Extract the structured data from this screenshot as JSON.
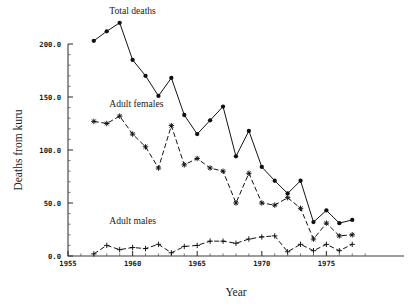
{
  "chart_data": {
    "type": "line",
    "title": "",
    "xlabel": "Year",
    "ylabel": "Deaths from kuru",
    "xlim": [
      1955,
      1978
    ],
    "ylim": [
      0,
      230
    ],
    "grid": false,
    "legend_position": "inline-annotations",
    "x_ticks": [
      "1955",
      "1960",
      "1965",
      "1970",
      "1975"
    ],
    "x_tick_values": [
      1955,
      1960,
      1965,
      1970,
      1975
    ],
    "y_ticks": [
      "0.0",
      "50.0",
      "100.0",
      "150.0",
      "200.0"
    ],
    "y_tick_values": [
      0,
      50,
      100,
      150,
      200
    ],
    "x": [
      1957,
      1958,
      1959,
      1960,
      1961,
      1962,
      1963,
      1964,
      1965,
      1966,
      1967,
      1968,
      1969,
      1970,
      1971,
      1972,
      1973,
      1974,
      1975,
      1976,
      1977
    ],
    "series": [
      {
        "name": "Total deaths",
        "marker": "filled-circle",
        "linestyle": "solid",
        "color": "#101010",
        "values": [
          203,
          212,
          220,
          185,
          170,
          151,
          168,
          133,
          115,
          128,
          141,
          94,
          118,
          84,
          71,
          59,
          71,
          32,
          43,
          31,
          34
        ]
      },
      {
        "name": "Adult females",
        "marker": "star",
        "linestyle": "dashed",
        "color": "#101010",
        "values": [
          127,
          125,
          132,
          115,
          103,
          83,
          123,
          86,
          92,
          83,
          80,
          50,
          78,
          50,
          48,
          55,
          45,
          16,
          31,
          19,
          20
        ]
      },
      {
        "name": "Adult males",
        "marker": "plus",
        "linestyle": "dashed",
        "color": "#101010",
        "values": [
          2,
          10,
          6,
          8,
          7,
          11,
          3,
          9,
          10,
          14,
          14,
          12,
          16,
          18,
          19,
          4,
          11,
          5,
          11,
          5,
          11
        ]
      }
    ],
    "annotations": [
      {
        "text": "Total deaths",
        "x": 1958.2,
        "y": 228
      },
      {
        "text": "Adult females",
        "x": 1958.2,
        "y": 141
      },
      {
        "text": "Adult males",
        "x": 1958.2,
        "y": 30
      }
    ]
  },
  "axes": {
    "x_label": "Year",
    "y_label": "Deaths from kuru"
  }
}
